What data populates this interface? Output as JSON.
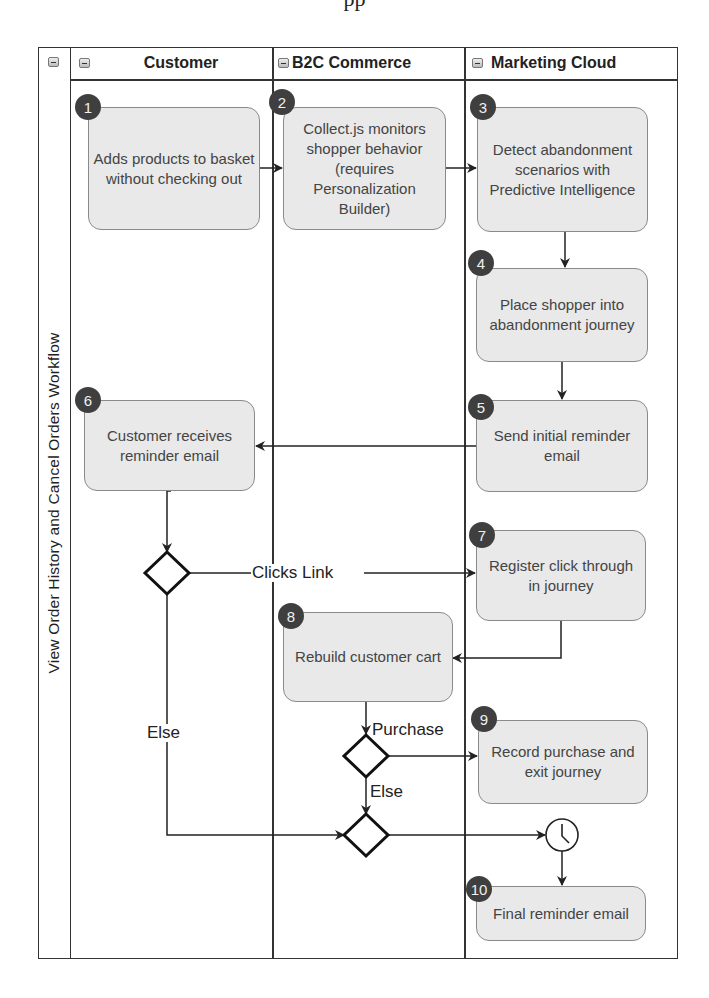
{
  "clipped_heading": "pp",
  "pool": {
    "title": "View Order History and Cancel Orders Workflow"
  },
  "lanes": [
    {
      "name": "Customer"
    },
    {
      "name": "B2C Commerce"
    },
    {
      "name": "Marketing Cloud"
    }
  ],
  "steps": [
    {
      "num": "1",
      "text": "Adds products to basket without checking out",
      "lane": "Customer"
    },
    {
      "num": "2",
      "text": "Collect.js monitors shopper behavior (requires Personalization Builder)",
      "lane": "B2C Commerce"
    },
    {
      "num": "3",
      "text": "Detect abandonment scenarios with Predictive Intelligence",
      "lane": "Marketing Cloud"
    },
    {
      "num": "4",
      "text": "Place shopper into abandonment journey",
      "lane": "Marketing Cloud"
    },
    {
      "num": "5",
      "text": "Send initial reminder email",
      "lane": "Marketing Cloud"
    },
    {
      "num": "6",
      "text": "Customer receives reminder email",
      "lane": "Customer"
    },
    {
      "num": "7",
      "text": "Register click through in journey",
      "lane": "Marketing Cloud"
    },
    {
      "num": "8",
      "text": "Rebuild customer cart",
      "lane": "B2C Commerce"
    },
    {
      "num": "9",
      "text": "Record purchase and exit journey",
      "lane": "Marketing Cloud"
    },
    {
      "num": "10",
      "text": "Final reminder email",
      "lane": "Marketing Cloud"
    }
  ],
  "edge_labels": {
    "clicks_link": "Clicks Link",
    "else_left": "Else",
    "purchase": "Purchase",
    "else_mid": "Else"
  },
  "colors": {
    "box_fill": "#e9e9e9",
    "box_border": "#8a8a8a",
    "badge_fill": "#3f3f3f",
    "line": "#222222"
  }
}
